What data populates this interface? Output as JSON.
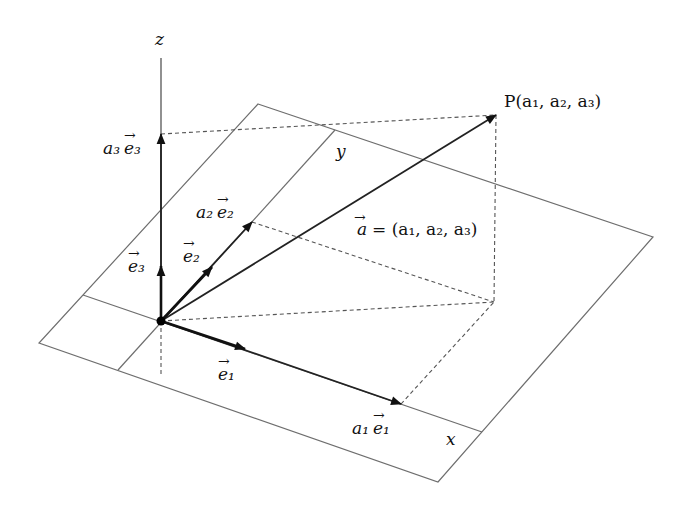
{
  "diagram": {
    "axes": {
      "x": {
        "label": "x"
      },
      "y": {
        "label": "y"
      },
      "z": {
        "label": "z"
      }
    },
    "point": {
      "label_prefix": "P",
      "coords_text": "(a1, a2, a3)",
      "label_full": "P(a₁, a₂, a₃)"
    },
    "vector_a": {
      "name": "a",
      "label_full": "a⃗ = (a₁, a₂, a₃)",
      "rhs": "= (a₁, a₂, a₃)"
    },
    "basis": {
      "e1": {
        "label": "e₁"
      },
      "e2": {
        "label": "e₂"
      },
      "e3": {
        "label": "e₃"
      }
    },
    "components": {
      "a1e1": {
        "coef": "a₁",
        "vec": "e₁"
      },
      "a2e2": {
        "coef": "a₂",
        "vec": "e₂"
      },
      "a3e3": {
        "coef": "a₃",
        "vec": "e₃"
      }
    },
    "geometry": {
      "origin": [
        161,
        321
      ],
      "plane_corners": [
        [
          258,
          104
        ],
        [
          653,
          237
        ],
        [
          438,
          482
        ],
        [
          39,
          343
        ]
      ],
      "P": [
        496,
        115
      ],
      "foot": [
        494,
        302
      ]
    }
  }
}
